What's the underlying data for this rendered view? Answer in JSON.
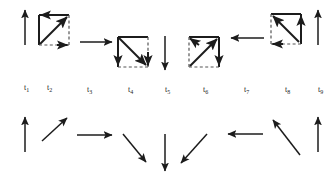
{
  "figure": {
    "title": "",
    "background_color": "#ffffff",
    "ink_color": "#1c1c1c",
    "width": 336,
    "height": 180
  },
  "time_axis": {
    "name": "time-step-labels",
    "labels": [
      {
        "text": "t",
        "subscript": "1",
        "x": 24,
        "y": 84
      },
      {
        "text": "t",
        "subscript": "2",
        "x": 47,
        "y": 84
      },
      {
        "text": "t",
        "subscript": "3",
        "x": 87,
        "y": 86
      },
      {
        "text": "t",
        "subscript": "4",
        "x": 128,
        "y": 86
      },
      {
        "text": "t",
        "subscript": "5",
        "x": 165,
        "y": 86
      },
      {
        "text": "t",
        "subscript": "6",
        "x": 203,
        "y": 86
      },
      {
        "text": "t",
        "subscript": "7",
        "x": 244,
        "y": 86
      },
      {
        "text": "t",
        "subscript": "8",
        "x": 285,
        "y": 86
      },
      {
        "text": "t",
        "subscript": "9",
        "x": 318,
        "y": 86
      }
    ]
  },
  "top_row": {
    "name": "rotating-square-sequence",
    "description": "Alternating plain direction arrows and squares containing a diagonal double-arrow",
    "items": [
      {
        "kind": "arrow",
        "step": "t1",
        "direction": "up",
        "x1": 25,
        "y1": 45,
        "x2": 25,
        "y2": 9
      },
      {
        "kind": "square",
        "step": "t2",
        "diagonal": "up-right",
        "corner_arrows": [
          "top-left",
          "bottom-right"
        ],
        "x": 39,
        "y": 15,
        "size": 30,
        "dashed_edges": [
          "right",
          "bottom"
        ]
      },
      {
        "kind": "arrow",
        "step": "t3",
        "direction": "right",
        "x1": 80,
        "y1": 42,
        "x2": 113,
        "y2": 42
      },
      {
        "kind": "square",
        "step": "t4",
        "diagonal": "down-right",
        "corner_arrows": [
          "bottom-left",
          "bottom-right"
        ],
        "x": 118,
        "y": 37,
        "size": 30,
        "dashed_edges": [
          "bottom",
          "right"
        ]
      },
      {
        "kind": "arrow",
        "step": "t5",
        "direction": "down",
        "x1": 165,
        "y1": 36,
        "x2": 165,
        "y2": 71
      },
      {
        "kind": "square",
        "step": "t6",
        "diagonal": "up-right",
        "corner_arrows": [
          "top-left",
          "bottom-right"
        ],
        "x": 189,
        "y": 37,
        "size": 30,
        "dashed_edges": [
          "bottom",
          "left"
        ]
      },
      {
        "kind": "arrow",
        "step": "t7",
        "direction": "left",
        "x1": 264,
        "y1": 38,
        "x2": 230,
        "y2": 38
      },
      {
        "kind": "square",
        "step": "t8",
        "diagonal": "up-right",
        "corner_arrows": [
          "top-left",
          "top-right",
          "bottom-left"
        ],
        "x": 271,
        "y": 14,
        "size": 30,
        "dashed_edges": [
          "left",
          "bottom"
        ]
      },
      {
        "kind": "arrow",
        "step": "t9",
        "direction": "up",
        "x1": 318,
        "y1": 45,
        "x2": 318,
        "y2": 9
      }
    ]
  },
  "bottom_row": {
    "name": "clockwise-arrow-cycle",
    "description": "Nine arrows sweeping one full clockwise revolution from up, through right and down, back to up",
    "items": [
      {
        "step": "t1",
        "direction": "up",
        "angle_deg": 0,
        "x1": 25,
        "y1": 152,
        "x2": 25,
        "y2": 116
      },
      {
        "step": "t2",
        "direction": "up-right",
        "angle_deg": 45,
        "x1": 42,
        "y1": 141,
        "x2": 68,
        "y2": 117
      },
      {
        "step": "t3",
        "direction": "right",
        "angle_deg": 90,
        "x1": 77,
        "y1": 135,
        "x2": 113,
        "y2": 135
      },
      {
        "step": "t4",
        "direction": "down-right",
        "angle_deg": 135,
        "x1": 123,
        "y1": 134,
        "x2": 147,
        "y2": 163
      },
      {
        "step": "t5",
        "direction": "down",
        "angle_deg": 180,
        "x1": 165,
        "y1": 134,
        "x2": 165,
        "y2": 172
      },
      {
        "step": "t6",
        "direction": "down-left",
        "angle_deg": 225,
        "x1": 207,
        "y1": 134,
        "x2": 180,
        "y2": 164
      },
      {
        "step": "t7",
        "direction": "left",
        "angle_deg": 270,
        "x1": 263,
        "y1": 134,
        "x2": 227,
        "y2": 134
      },
      {
        "step": "t8",
        "direction": "up-left",
        "angle_deg": 315,
        "x1": 300,
        "y1": 155,
        "x2": 272,
        "y2": 119
      },
      {
        "step": "t9",
        "direction": "up",
        "angle_deg": 360,
        "x1": 318,
        "y1": 152,
        "x2": 318,
        "y2": 116
      }
    ]
  }
}
